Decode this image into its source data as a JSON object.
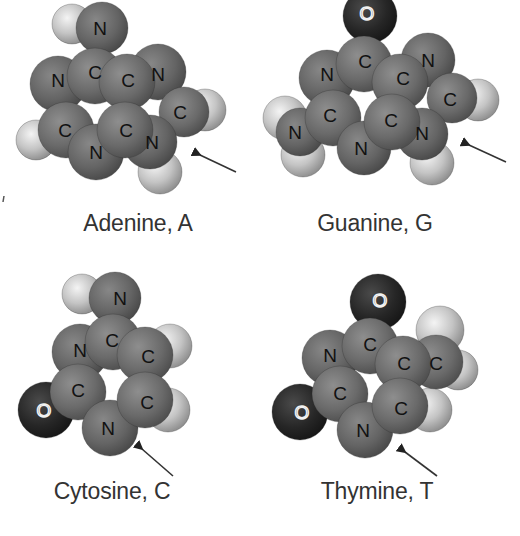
{
  "figure": {
    "molecules": [
      {
        "name": "Adenine",
        "symbol": "A",
        "caption": "Adenine, A",
        "caption_pos": [
          138,
          224
        ],
        "arrow": {
          "from": [
            236,
            172
          ],
          "to": [
            200,
            155
          ]
        },
        "atoms": [
          {
            "el": "H",
            "x": 72,
            "y": 24,
            "r": 20
          },
          {
            "el": "H",
            "x": 36,
            "y": 140,
            "r": 20
          },
          {
            "el": "H",
            "x": 160,
            "y": 172,
            "r": 22
          },
          {
            "el": "H",
            "x": 205,
            "y": 110,
            "r": 21
          },
          {
            "el": "N",
            "x": 102,
            "y": 28,
            "r": 26
          },
          {
            "el": "N",
            "x": 58,
            "y": 84,
            "r": 28
          },
          {
            "el": "N",
            "x": 158,
            "y": 72,
            "r": 28
          },
          {
            "el": "C",
            "x": 184,
            "y": 112,
            "r": 25
          },
          {
            "el": "C",
            "x": 66,
            "y": 130,
            "r": 28
          },
          {
            "el": "N",
            "x": 96,
            "y": 152,
            "r": 28
          },
          {
            "el": "N",
            "x": 150,
            "y": 142,
            "r": 27
          },
          {
            "el": "C",
            "x": 95,
            "y": 76,
            "r": 28
          },
          {
            "el": "C",
            "x": 127,
            "y": 82,
            "r": 28
          },
          {
            "el": "C",
            "x": 125,
            "y": 130,
            "r": 28
          }
        ],
        "labels": [
          {
            "t": "N",
            "x": 100,
            "y": 28
          },
          {
            "t": "C",
            "x": 95,
            "y": 72
          },
          {
            "t": "N",
            "x": 58,
            "y": 80
          },
          {
            "t": "C",
            "x": 128,
            "y": 80
          },
          {
            "t": "N",
            "x": 158,
            "y": 74
          },
          {
            "t": "C",
            "x": 180,
            "y": 112
          },
          {
            "t": "C",
            "x": 65,
            "y": 130
          },
          {
            "t": "C",
            "x": 126,
            "y": 130
          },
          {
            "t": "N",
            "x": 152,
            "y": 142
          },
          {
            "t": "N",
            "x": 96,
            "y": 152
          }
        ]
      },
      {
        "name": "Guanine",
        "symbol": "G",
        "caption": "Guanine, G",
        "caption_pos": [
          375,
          225
        ],
        "arrow": {
          "from": [
            506,
            162
          ],
          "to": [
            469,
            145
          ]
        },
        "atoms": [
          {
            "el": "H",
            "x": 285,
            "y": 118,
            "r": 22
          },
          {
            "el": "H",
            "x": 303,
            "y": 155,
            "r": 22
          },
          {
            "el": "H",
            "x": 432,
            "y": 163,
            "r": 22
          },
          {
            "el": "H",
            "x": 478,
            "y": 100,
            "r": 21
          },
          {
            "el": "O",
            "x": 370,
            "y": 16,
            "r": 27
          },
          {
            "el": "N",
            "x": 327,
            "y": 78,
            "r": 28
          },
          {
            "el": "N",
            "x": 428,
            "y": 60,
            "r": 27
          },
          {
            "el": "C",
            "x": 452,
            "y": 98,
            "r": 25
          },
          {
            "el": "N",
            "x": 300,
            "y": 132,
            "r": 24
          },
          {
            "el": "C",
            "x": 333,
            "y": 118,
            "r": 28
          },
          {
            "el": "N",
            "x": 364,
            "y": 148,
            "r": 27
          },
          {
            "el": "N",
            "x": 422,
            "y": 134,
            "r": 26
          },
          {
            "el": "C",
            "x": 364,
            "y": 64,
            "r": 28
          },
          {
            "el": "C",
            "x": 400,
            "y": 82,
            "r": 28
          },
          {
            "el": "C",
            "x": 392,
            "y": 122,
            "r": 28
          }
        ],
        "labels": [
          {
            "t": "O",
            "x": 367,
            "y": 13
          },
          {
            "t": "C",
            "x": 365,
            "y": 61
          },
          {
            "t": "N",
            "x": 327,
            "y": 74
          },
          {
            "t": "C",
            "x": 403,
            "y": 78
          },
          {
            "t": "N",
            "x": 428,
            "y": 60
          },
          {
            "t": "C",
            "x": 450,
            "y": 99
          },
          {
            "t": "C",
            "x": 330,
            "y": 115
          },
          {
            "t": "C",
            "x": 391,
            "y": 120
          },
          {
            "t": "N",
            "x": 422,
            "y": 133
          },
          {
            "t": "N",
            "x": 295,
            "y": 132
          },
          {
            "t": "N",
            "x": 361,
            "y": 148
          }
        ]
      },
      {
        "name": "Cytosine",
        "symbol": "C",
        "caption": "Cytosine, C",
        "caption_pos": [
          112,
          492
        ],
        "arrow": {
          "from": [
            173,
            476
          ],
          "to": [
            142,
            449
          ]
        },
        "atoms": [
          {
            "el": "H",
            "x": 82,
            "y": 294,
            "r": 20
          },
          {
            "el": "H",
            "x": 170,
            "y": 346,
            "r": 22
          },
          {
            "el": "H",
            "x": 168,
            "y": 410,
            "r": 22
          },
          {
            "el": "O",
            "x": 46,
            "y": 410,
            "r": 28
          },
          {
            "el": "N",
            "x": 115,
            "y": 298,
            "r": 26
          },
          {
            "el": "N",
            "x": 80,
            "y": 352,
            "r": 28
          },
          {
            "el": "C",
            "x": 78,
            "y": 392,
            "r": 28
          },
          {
            "el": "N",
            "x": 110,
            "y": 428,
            "r": 28
          },
          {
            "el": "C",
            "x": 113,
            "y": 342,
            "r": 28
          },
          {
            "el": "C",
            "x": 145,
            "y": 355,
            "r": 28
          },
          {
            "el": "C",
            "x": 145,
            "y": 400,
            "r": 28
          }
        ],
        "labels": [
          {
            "t": "N",
            "x": 120,
            "y": 298
          },
          {
            "t": "C",
            "x": 112,
            "y": 340
          },
          {
            "t": "N",
            "x": 80,
            "y": 350
          },
          {
            "t": "C",
            "x": 148,
            "y": 356
          },
          {
            "t": "C",
            "x": 78,
            "y": 390
          },
          {
            "t": "C",
            "x": 147,
            "y": 402
          },
          {
            "t": "N",
            "x": 108,
            "y": 428
          },
          {
            "t": "O",
            "x": 44,
            "y": 410
          }
        ]
      },
      {
        "name": "Thymine",
        "symbol": "T",
        "caption": "Thymine, T",
        "caption_pos": [
          377,
          492
        ],
        "arrow": {
          "from": [
            437,
            476
          ],
          "to": [
            405,
            452
          ]
        },
        "atoms": [
          {
            "el": "H",
            "x": 440,
            "y": 330,
            "r": 24
          },
          {
            "el": "H",
            "x": 458,
            "y": 370,
            "r": 20
          },
          {
            "el": "H",
            "x": 430,
            "y": 410,
            "r": 22
          },
          {
            "el": "O",
            "x": 378,
            "y": 302,
            "r": 28
          },
          {
            "el": "O",
            "x": 300,
            "y": 412,
            "r": 28
          },
          {
            "el": "N",
            "x": 330,
            "y": 358,
            "r": 28
          },
          {
            "el": "C",
            "x": 436,
            "y": 362,
            "r": 27
          },
          {
            "el": "C",
            "x": 340,
            "y": 394,
            "r": 28
          },
          {
            "el": "N",
            "x": 365,
            "y": 430,
            "r": 28
          },
          {
            "el": "C",
            "x": 370,
            "y": 346,
            "r": 28
          },
          {
            "el": "C",
            "x": 403,
            "y": 364,
            "r": 28
          },
          {
            "el": "C",
            "x": 400,
            "y": 406,
            "r": 28
          }
        ],
        "labels": [
          {
            "t": "O",
            "x": 380,
            "y": 300
          },
          {
            "t": "C",
            "x": 370,
            "y": 344
          },
          {
            "t": "N",
            "x": 330,
            "y": 355
          },
          {
            "t": "C",
            "x": 404,
            "y": 363
          },
          {
            "t": "C",
            "x": 436,
            "y": 363
          },
          {
            "t": "C",
            "x": 340,
            "y": 393
          },
          {
            "t": "C",
            "x": 401,
            "y": 408
          },
          {
            "t": "N",
            "x": 363,
            "y": 430
          },
          {
            "t": "O",
            "x": 302,
            "y": 412
          }
        ]
      }
    ],
    "colors": {
      "C": "#6e6e6e",
      "N": "#6a6a6a",
      "O": "#2a2a2a",
      "H": "#c8c8c8",
      "background": "#ffffff",
      "text": "#333333",
      "arrow": "#222222"
    }
  }
}
